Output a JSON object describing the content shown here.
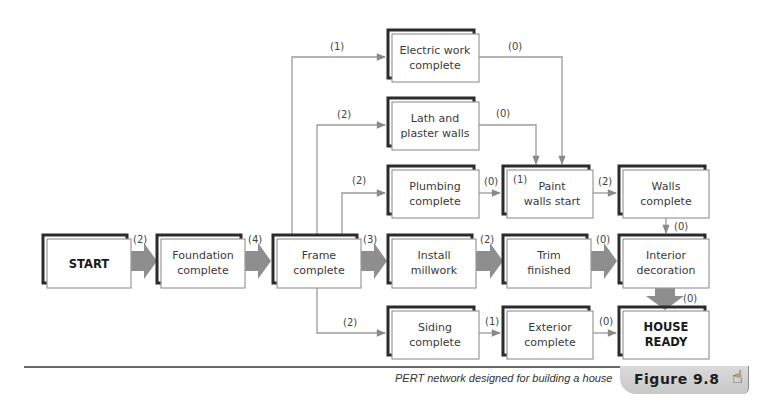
{
  "figure": {
    "label": "Figure 9.8",
    "caption": "PERT network designed for building a house",
    "icon": "pointing-hand-icon"
  },
  "colors": {
    "box_border_dark": "#2b2b2b",
    "box_border_light": "#9a9a9a",
    "arrow_gray": "#8e8e8e",
    "rule": "#6a6a6a",
    "tab_bg": "#d0d0d0"
  },
  "nodes": {
    "start": {
      "lines": [
        "START"
      ],
      "bold": true
    },
    "foundation": {
      "lines": [
        "Foundation",
        "complete"
      ]
    },
    "frame": {
      "lines": [
        "Frame",
        "complete"
      ]
    },
    "electric": {
      "lines": [
        "Electric work",
        "complete"
      ]
    },
    "lath": {
      "lines": [
        "Lath and",
        "plaster walls"
      ]
    },
    "plumbing": {
      "lines": [
        "Plumbing",
        "complete"
      ]
    },
    "paint": {
      "lines": [
        "Paint",
        "walls start"
      ],
      "inner_label": "(1)"
    },
    "walls": {
      "lines": [
        "Walls",
        "complete"
      ]
    },
    "millwork": {
      "lines": [
        "Install",
        "millwork"
      ]
    },
    "trim": {
      "lines": [
        "Trim",
        "finished"
      ]
    },
    "interior": {
      "lines": [
        "Interior",
        "decoration"
      ]
    },
    "siding": {
      "lines": [
        "Siding",
        "complete"
      ]
    },
    "exterior": {
      "lines": [
        "Exterior",
        "complete"
      ]
    },
    "house": {
      "lines": [
        "HOUSE",
        "READY"
      ],
      "bold": true
    }
  },
  "edges": [
    {
      "from": "start",
      "to": "foundation",
      "label": "(2)",
      "critical": true
    },
    {
      "from": "foundation",
      "to": "frame",
      "label": "(4)",
      "critical": true
    },
    {
      "from": "frame",
      "to": "electric",
      "label": "(1)"
    },
    {
      "from": "frame",
      "to": "lath",
      "label": "(2)"
    },
    {
      "from": "frame",
      "to": "plumbing",
      "label": "(2)"
    },
    {
      "from": "frame",
      "to": "millwork",
      "label": "(3)",
      "critical": true
    },
    {
      "from": "frame",
      "to": "siding",
      "label": "(2)"
    },
    {
      "from": "electric",
      "to": "paint",
      "label": "(0)"
    },
    {
      "from": "lath",
      "to": "paint",
      "label": "(0)"
    },
    {
      "from": "plumbing",
      "to": "paint",
      "label": "(0)"
    },
    {
      "from": "paint",
      "to": "walls",
      "label": "(2)"
    },
    {
      "from": "walls",
      "to": "interior",
      "label": "(0)"
    },
    {
      "from": "millwork",
      "to": "trim",
      "label": "(2)",
      "critical": true
    },
    {
      "from": "trim",
      "to": "interior",
      "label": "(0)",
      "critical": true
    },
    {
      "from": "interior",
      "to": "house",
      "label": "(0)",
      "critical": true
    },
    {
      "from": "siding",
      "to": "exterior",
      "label": "(1)"
    },
    {
      "from": "exterior",
      "to": "house",
      "label": "(0)"
    }
  ]
}
